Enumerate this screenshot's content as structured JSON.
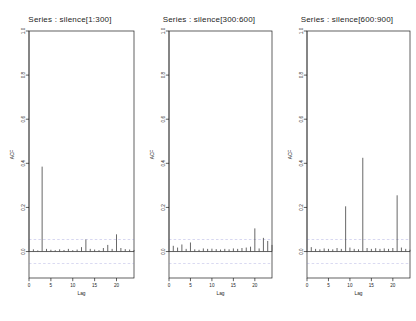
{
  "figure": {
    "background": "#ffffff",
    "foreground": "#1d1d1d",
    "conf_color": "#7a7ad0",
    "spike_color": "#4d4d4d",
    "panel_count": 3
  },
  "chart_data": [
    {
      "type": "bar",
      "title": "Series : silence[1:300]",
      "xlabel": "Lag",
      "ylabel": "ACF",
      "xlim": [
        0,
        24
      ],
      "ylim": [
        -0.12,
        1.0
      ],
      "xticks": [
        0,
        5,
        10,
        15,
        20
      ],
      "yticks": [
        0.0,
        0.2,
        0.4,
        0.6,
        0.8,
        1.0
      ],
      "ytick_labels": [
        "0.0",
        "0.2",
        "0.4",
        "0.6",
        "0.8",
        "1.0"
      ],
      "xtick_labels": [
        "0",
        "5",
        "10",
        "15",
        "20"
      ],
      "grid": false,
      "legend": "none",
      "conf_level": -0.055,
      "x": [
        0,
        1,
        2,
        3,
        4,
        5,
        6,
        7,
        8,
        9,
        10,
        11,
        12,
        13,
        14,
        15,
        16,
        17,
        18,
        19,
        20,
        21,
        22,
        23,
        24
      ],
      "values": [
        1.0,
        0.01,
        0.005,
        0.385,
        0.012,
        0.008,
        0.006,
        0.01,
        0.007,
        0.012,
        0.006,
        0.009,
        0.02,
        0.055,
        0.012,
        0.009,
        0.006,
        0.016,
        0.03,
        0.012,
        0.078,
        0.016,
        0.011,
        0.009,
        0.007
      ]
    },
    {
      "type": "bar",
      "title": "Series : silence[300:600]",
      "xlabel": "Lag",
      "ylabel": "ACF",
      "xlim": [
        0,
        24
      ],
      "ylim": [
        -0.12,
        1.0
      ],
      "xticks": [
        0,
        5,
        10,
        15,
        20
      ],
      "yticks": [
        0.0,
        0.2,
        0.4,
        0.6,
        0.8,
        1.0
      ],
      "ytick_labels": [
        "0.0",
        "0.2",
        "0.4",
        "0.6",
        "0.8",
        "1.0"
      ],
      "xtick_labels": [
        "0",
        "5",
        "10",
        "15",
        "20"
      ],
      "grid": false,
      "legend": "none",
      "conf_level": -0.055,
      "x": [
        0,
        1,
        2,
        3,
        4,
        5,
        6,
        7,
        8,
        9,
        10,
        11,
        12,
        13,
        14,
        15,
        16,
        17,
        18,
        19,
        20,
        21,
        22,
        23,
        24
      ],
      "values": [
        1.0,
        0.026,
        0.018,
        0.032,
        0.012,
        0.041,
        0.01,
        0.008,
        0.014,
        0.012,
        0.013,
        0.011,
        0.009,
        0.012,
        0.01,
        0.014,
        0.012,
        0.016,
        0.018,
        0.022,
        0.105,
        0.014,
        0.062,
        0.048,
        0.03
      ]
    },
    {
      "type": "bar",
      "title": "Series : silence[600:900]",
      "xlabel": "Lag",
      "ylabel": "ACF",
      "xlim": [
        0,
        24
      ],
      "ylim": [
        -0.12,
        1.0
      ],
      "xticks": [
        0,
        5,
        10,
        15,
        20
      ],
      "yticks": [
        0.0,
        0.2,
        0.4,
        0.6,
        0.8,
        1.0
      ],
      "ytick_labels": [
        "0.0",
        "0.2",
        "0.4",
        "0.6",
        "0.8",
        "1.0"
      ],
      "xtick_labels": [
        "0",
        "5",
        "10",
        "15",
        "20"
      ],
      "grid": false,
      "legend": "none",
      "conf_level": -0.055,
      "x": [
        0,
        1,
        2,
        3,
        4,
        5,
        6,
        7,
        8,
        9,
        10,
        11,
        12,
        13,
        14,
        15,
        16,
        17,
        18,
        19,
        20,
        21,
        22,
        23,
        24
      ],
      "values": [
        1.0,
        0.02,
        0.012,
        0.01,
        0.014,
        0.012,
        0.01,
        0.016,
        0.012,
        0.205,
        0.018,
        0.012,
        0.01,
        0.425,
        0.016,
        0.012,
        0.015,
        0.012,
        0.014,
        0.012,
        0.016,
        0.255,
        0.018,
        0.012,
        0.008
      ]
    }
  ]
}
